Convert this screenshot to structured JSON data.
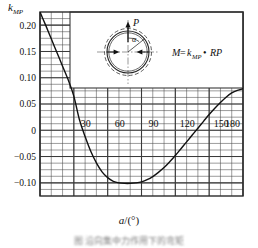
{
  "chart_data": {
    "type": "line",
    "title": "",
    "xlabel": "a/(°)",
    "ylabel": "k_MP",
    "xlim": [
      0,
      180
    ],
    "ylim": [
      -0.125,
      0.225
    ],
    "grid": true,
    "legend": "none",
    "x_ticks": [
      30,
      60,
      90,
      120,
      150,
      180
    ],
    "x_tick_labels": [
      "30",
      "60",
      "90",
      "120",
      "150",
      "180"
    ],
    "x_minor_step": 10,
    "y_ticks": [
      0.2,
      0.15,
      0.1,
      0.05,
      0,
      -0.05,
      -0.1
    ],
    "y_tick_labels": [
      "0.20",
      "0.15",
      "0.10",
      "0.05",
      "0",
      "−0.05",
      "−0.10"
    ],
    "y_minor_step": 0.0125,
    "series": [
      {
        "name": "k_MP",
        "x": [
          0,
          5,
          10,
          15,
          20,
          25,
          30,
          35,
          40,
          45,
          50,
          55,
          60,
          65,
          70,
          75,
          80,
          85,
          90,
          95,
          100,
          105,
          110,
          115,
          120,
          125,
          130,
          135,
          140,
          145,
          150,
          155,
          160,
          165,
          170,
          175,
          180
        ],
        "y": [
          0.225,
          0.2,
          0.174,
          0.148,
          0.122,
          0.096,
          0.065,
          0.02,
          -0.012,
          -0.04,
          -0.062,
          -0.079,
          -0.09,
          -0.097,
          -0.1,
          -0.101,
          -0.101,
          -0.1,
          -0.098,
          -0.094,
          -0.088,
          -0.08,
          -0.071,
          -0.06,
          -0.048,
          -0.035,
          -0.022,
          -0.009,
          0.004,
          0.017,
          0.03,
          0.042,
          0.053,
          0.063,
          0.071,
          0.076,
          0.079
        ]
      }
    ],
    "annotations": {
      "zero_crossing_deg": 37,
      "minimum": {
        "x": 82,
        "y": -0.101
      },
      "start": {
        "x": 0,
        "y": 0.225
      },
      "end": {
        "x": 180,
        "y": 0.079
      }
    }
  },
  "axes": {
    "y_label_main": "k",
    "y_label_sub": "MP",
    "x_title_var": "a",
    "x_title_unit": "/(°)"
  },
  "inset": {
    "force_label": "P",
    "angle_label": "α",
    "formula_m": "M",
    "formula_eq": "=",
    "formula_k": "k",
    "formula_k_sub": "MP",
    "formula_dot": "•",
    "formula_rp": "RP"
  },
  "caption": {
    "text": "图  沿向集中力作用下的弯矩"
  }
}
